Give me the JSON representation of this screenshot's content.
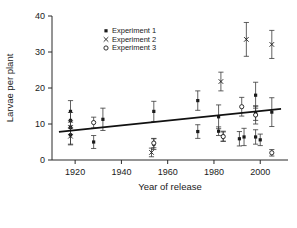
{
  "chart_data": {
    "type": "scatter",
    "title": "",
    "xlabel": "Year of release",
    "ylabel": "Larvae per plant",
    "xlim": [
      1910,
      2012
    ],
    "ylim": [
      0,
      40
    ],
    "xticks": [
      1920,
      1940,
      1960,
      1980,
      2000
    ],
    "yticks": [
      0,
      10,
      20,
      30,
      40
    ],
    "grid": false,
    "legend_position": "upper-left-inside",
    "legend": [
      {
        "name": "Experiment 1",
        "marker": "filled-square"
      },
      {
        "name": "Experiment 2",
        "marker": "cross-x"
      },
      {
        "name": "Experiment 3",
        "marker": "open-circle"
      }
    ],
    "trendline": {
      "x": [
        1913,
        2009
      ],
      "y": [
        7.8,
        14.2
      ],
      "note": "linear regression fit"
    },
    "series": [
      {
        "name": "Experiment 1",
        "marker": "filled-square",
        "points": [
          {
            "x": 1918,
            "y": 13.5,
            "err": 3.0
          },
          {
            "x": 1918,
            "y": 11.0,
            "err": 2.2
          },
          {
            "x": 1918,
            "y": 9.0,
            "err": 2.0
          },
          {
            "x": 1918,
            "y": 7.0,
            "err": 2.6
          },
          {
            "x": 1928,
            "y": 5.0,
            "err": 1.8
          },
          {
            "x": 1932,
            "y": 11.3,
            "err": 3.1
          },
          {
            "x": 1954,
            "y": 13.5,
            "err": 2.8
          },
          {
            "x": 1954,
            "y": 4.4,
            "err": 1.5
          },
          {
            "x": 1973,
            "y": 16.5,
            "err": 2.7
          },
          {
            "x": 1973,
            "y": 7.9,
            "err": 1.9
          },
          {
            "x": 1982,
            "y": 12.0,
            "err": 3.3
          },
          {
            "x": 1982,
            "y": 8.0,
            "err": 1.2
          },
          {
            "x": 1984,
            "y": 6.6,
            "err": 1.4
          },
          {
            "x": 1991,
            "y": 5.9,
            "err": 2.0
          },
          {
            "x": 1993,
            "y": 6.4,
            "err": 2.4
          },
          {
            "x": 1998,
            "y": 18.0,
            "err": 3.6
          },
          {
            "x": 1998,
            "y": 13.0,
            "err": 2.0
          },
          {
            "x": 1998,
            "y": 6.4,
            "err": 2.0
          },
          {
            "x": 2000,
            "y": 5.6,
            "err": 1.6
          },
          {
            "x": 2005,
            "y": 13.3,
            "err": 4.0
          }
        ]
      },
      {
        "name": "Experiment 2",
        "marker": "cross-x",
        "points": [
          {
            "x": 1918,
            "y": 6.6,
            "err": 2.4
          },
          {
            "x": 1953,
            "y": 2.1,
            "err": 1.2
          },
          {
            "x": 1983,
            "y": 21.8,
            "err": 2.6
          },
          {
            "x": 1994,
            "y": 33.5,
            "err": 4.7
          },
          {
            "x": 2005,
            "y": 32.1,
            "err": 3.9
          }
        ]
      },
      {
        "name": "Experiment 3",
        "marker": "open-circle",
        "points": [
          {
            "x": 1928,
            "y": 10.4,
            "err": 1.5
          },
          {
            "x": 1954,
            "y": 4.7,
            "err": 1.3
          },
          {
            "x": 1984,
            "y": 6.5,
            "err": 1.3
          },
          {
            "x": 1992,
            "y": 14.8,
            "err": 2.6
          },
          {
            "x": 1998,
            "y": 12.5,
            "err": 2.5
          },
          {
            "x": 2005,
            "y": 2.0,
            "err": 0.9
          }
        ]
      }
    ]
  }
}
